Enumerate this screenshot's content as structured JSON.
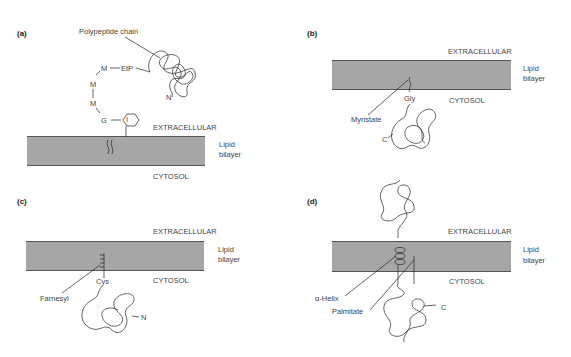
{
  "panels": [
    {
      "id": "a",
      "label": "(a)",
      "extracellular": "EXTRACELLULAR",
      "lipid_top": "Lipid",
      "lipid_bottom": "bilayer",
      "cytosol": "CYTOSOL",
      "polypeptide": "Polypeptide chain",
      "chain": [
        "M",
        "EtP",
        "M",
        "M",
        "G",
        "I"
      ],
      "n_term": "N"
    },
    {
      "id": "b",
      "label": "(b)",
      "extracellular": "EXTRACELLULAR",
      "lipid_top": "Lipid",
      "lipid_bottom": "bilayer",
      "cytosol": "CYTOSOL",
      "anchor_residue": "Gly",
      "anchor_lipid": "Myristate",
      "terminus": "C"
    },
    {
      "id": "c",
      "label": "(c)",
      "extracellular": "EXTRACELLULAR",
      "lipid_top": "Lipid",
      "lipid_bottom": "bilayer",
      "cytosol": "CYTOSOL",
      "anchor_residue": "Cys",
      "anchor_lipid": "Farnesyl",
      "terminus": "N"
    },
    {
      "id": "d",
      "label": "(d)",
      "extracellular": "EXTRACELLULAR",
      "lipid_top": "Lipid",
      "lipid_bottom": "bilayer",
      "cytosol": "CYTOSOL",
      "helix": "α-Helix",
      "anchor_lipid": "Palmitate",
      "terminus": "C"
    }
  ],
  "colors": {
    "membrane": "#a6a6a6",
    "membrane_edge": "#555555",
    "line": "#222222"
  }
}
